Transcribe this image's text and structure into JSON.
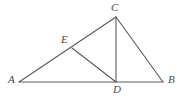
{
  "figure": {
    "width": 182,
    "height": 96,
    "background_color": "#ffffff",
    "stroke_color": "#5a5a5a",
    "label_color": "#4a4a4a",
    "stroke_width": 1.1,
    "points": [
      {
        "id": "A",
        "label": "A",
        "x": 19,
        "y": 82,
        "label_x": 8,
        "label_y": 74
      },
      {
        "id": "B",
        "label": "B",
        "x": 163,
        "y": 82,
        "label_x": 168,
        "label_y": 74
      },
      {
        "id": "C",
        "label": "C",
        "x": 116,
        "y": 17,
        "label_x": 111,
        "label_y": 2
      },
      {
        "id": "D",
        "label": "D",
        "x": 116,
        "y": 82,
        "label_x": 113,
        "label_y": 84
      },
      {
        "id": "E",
        "label": "E",
        "x": 72,
        "y": 48,
        "label_x": 61,
        "label_y": 34
      }
    ],
    "segments": [
      {
        "id": "AB",
        "name": "segment-ab",
        "from": "A",
        "to": "B"
      },
      {
        "id": "AC",
        "name": "segment-ac",
        "from": "A",
        "to": "C"
      },
      {
        "id": "CB",
        "name": "segment-cb",
        "from": "C",
        "to": "B"
      },
      {
        "id": "CD",
        "name": "segment-cd",
        "from": "C",
        "to": "D"
      },
      {
        "id": "ED",
        "name": "segment-ed",
        "from": "E",
        "to": "D"
      }
    ]
  }
}
